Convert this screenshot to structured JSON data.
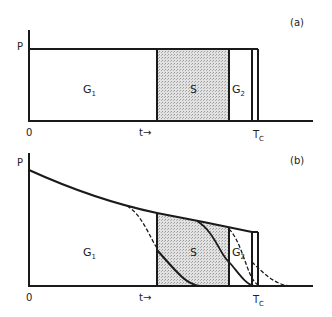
{
  "panels": [
    {
      "id": "a",
      "tag": "(a)",
      "y_label": "P",
      "origin_label": "0",
      "time_label": "t→",
      "tc_label": "T",
      "tc_sub": "C",
      "phases": [
        {
          "name": "G",
          "sub": "1"
        },
        {
          "name": "S",
          "sub": ""
        },
        {
          "name": "G",
          "sub": "2"
        }
      ]
    },
    {
      "id": "b",
      "tag": "(b)",
      "y_label": "P",
      "origin_label": "0",
      "time_label": "t→",
      "tc_label": "T",
      "tc_sub": "C",
      "phases": [
        {
          "name": "G",
          "sub": "1"
        },
        {
          "name": "S",
          "sub": ""
        },
        {
          "name": "G",
          "sub": "2"
        }
      ]
    }
  ],
  "colors": {
    "line": "#1a1a1a",
    "s_fill": "#d4d4d4"
  }
}
